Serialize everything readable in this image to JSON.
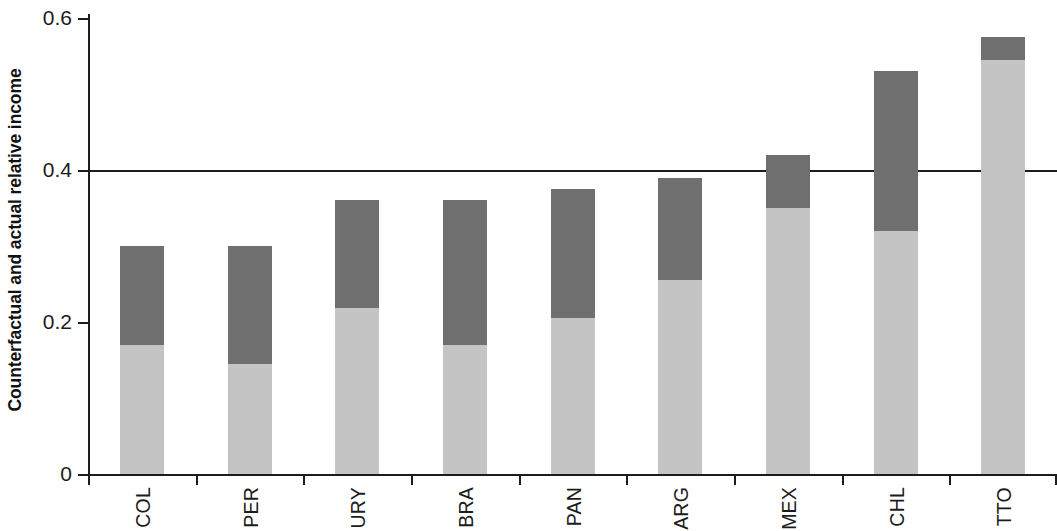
{
  "chart_data": {
    "type": "bar",
    "title": "",
    "subtitle": "",
    "xlabel": "",
    "ylabel": "Counterfactual and actual relative income",
    "categories": [
      "COL",
      "PER",
      "URY",
      "BRA",
      "PAN",
      "ARG",
      "MEX",
      "CHL",
      "TTO"
    ],
    "stacked": true,
    "ylim": [
      0,
      0.62
    ],
    "yticks": [
      0,
      0.2,
      0.4,
      0.6
    ],
    "ytick_labels": [
      "0",
      "0.2",
      "0.4",
      "0.6"
    ],
    "grid": false,
    "legend": "none",
    "reference_lines": [
      {
        "y": 0.4,
        "color": "#1c1c1c",
        "label": ""
      }
    ],
    "series": [
      {
        "name": "Actual relative income",
        "color": "#c4c4c4",
        "values": [
          0.17,
          0.145,
          0.218,
          0.17,
          0.205,
          0.255,
          0.35,
          0.32,
          0.545
        ]
      },
      {
        "name": "Counterfactual increment",
        "color": "#6f6f6f",
        "values": [
          0.13,
          0.155,
          0.142,
          0.19,
          0.17,
          0.135,
          0.07,
          0.21,
          0.03
        ]
      }
    ],
    "totals": [
      0.3,
      0.3,
      0.36,
      0.36,
      0.375,
      0.39,
      0.42,
      0.53,
      0.575
    ]
  },
  "axis": {
    "y_title": "Counterfactual and actual relative income",
    "y_tick_0": "0",
    "y_tick_1": "0.2",
    "y_tick_2": "0.4",
    "y_tick_3": "0.6"
  },
  "colors": {
    "actual": "#c4c4c4",
    "counterfactual": "#6f6f6f",
    "axis": "#1c1c1c",
    "background": "#ffffff"
  }
}
